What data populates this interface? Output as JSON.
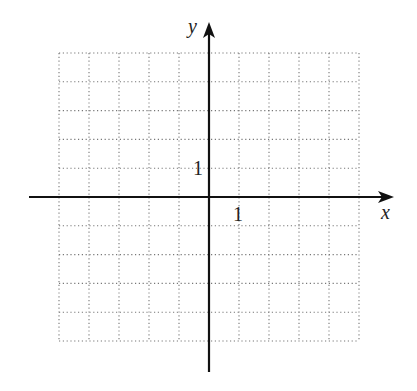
{
  "chart_data": {
    "type": "coordinate-grid",
    "title": "",
    "xlabel": "x",
    "ylabel": "y",
    "xlim": [
      -5,
      5
    ],
    "ylim": [
      -5,
      5
    ],
    "grid": true,
    "grid_style": "dotted",
    "tick_labels": {
      "x": [
        "1"
      ],
      "y": [
        "1"
      ]
    },
    "x_unit_tick": 1,
    "y_unit_tick": 1
  },
  "labels": {
    "x_axis": "x",
    "y_axis": "y",
    "x_tick_one": "1",
    "y_tick_one": "1"
  },
  "colors": {
    "axis": "#111111",
    "grid": "#777777",
    "background": "#ffffff"
  }
}
